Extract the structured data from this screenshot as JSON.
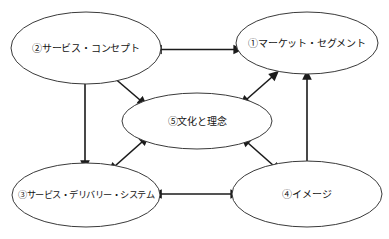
{
  "diagram": {
    "type": "service-management-relationship-diagram",
    "background_color": "#ffffff",
    "node_stroke_color": "#3a3a3a",
    "node_fill_color": "#ffffff",
    "connector_color": "#1b1b1b",
    "text_color": "#141414",
    "nodes": [
      {
        "id": "node-1",
        "label": "①マーケット・セグメント",
        "position": "top-right"
      },
      {
        "id": "node-2",
        "label": "②サービス・コンセプト",
        "position": "top-left"
      },
      {
        "id": "node-3",
        "label": "③サービス・デリバリー・システム",
        "position": "bottom-left"
      },
      {
        "id": "node-4",
        "label": "④イメージ",
        "position": "bottom-right"
      },
      {
        "id": "node-5",
        "label": "⑤文化と理念",
        "position": "center"
      }
    ],
    "connectors": [
      {
        "id": "connector-2-1",
        "from": "node-2",
        "to": "node-1",
        "style": "double-arrow",
        "orientation": "horizontal"
      },
      {
        "id": "connector-3-4",
        "from": "node-3",
        "to": "node-4",
        "style": "double-arrow",
        "orientation": "horizontal"
      },
      {
        "id": "connector-2-3",
        "from": "node-2",
        "to": "node-3",
        "style": "double-arrow",
        "orientation": "vertical"
      },
      {
        "id": "connector-1-4",
        "from": "node-1",
        "to": "node-4",
        "style": "double-arrow",
        "orientation": "vertical"
      },
      {
        "id": "connector-2-5",
        "from": "node-2",
        "to": "node-5",
        "style": "double-arrow",
        "orientation": "diagonal"
      },
      {
        "id": "connector-1-5",
        "from": "node-1",
        "to": "node-5",
        "style": "double-arrow",
        "orientation": "diagonal"
      },
      {
        "id": "connector-3-5",
        "from": "node-3",
        "to": "node-5",
        "style": "double-arrow",
        "orientation": "diagonal"
      },
      {
        "id": "connector-4-5",
        "from": "node-4",
        "to": "node-5",
        "style": "double-arrow",
        "orientation": "diagonal"
      }
    ]
  }
}
